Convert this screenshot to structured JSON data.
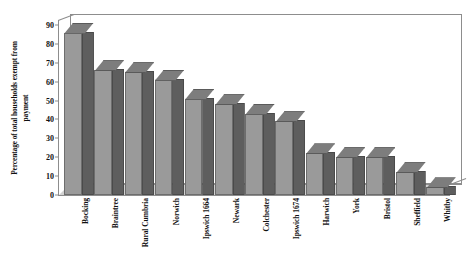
{
  "chart_data": {
    "type": "bar",
    "title": "",
    "xlabel": "",
    "ylabel": "Percentage of total households exempt from\npayment",
    "ylim": [
      0,
      90
    ],
    "yticks": [
      0,
      10,
      20,
      30,
      40,
      50,
      60,
      70,
      80,
      90
    ],
    "ytick_labels": [
      "0",
      "10",
      "20",
      "30",
      "40",
      "50",
      "60",
      "70",
      "80",
      "90"
    ],
    "grid": false,
    "legend": null,
    "style": "3d-column",
    "categories": [
      "Bocking",
      "Braintree",
      "Rural Cumbria",
      "Norwich",
      "Ipswich 1664",
      "Newark",
      "Colchester",
      "Ipswich 1674",
      "Harwich",
      "York",
      "Bristol",
      "Sheffield",
      "Whitby"
    ],
    "values": [
      86,
      66,
      65,
      61,
      51,
      48,
      43,
      39,
      22,
      20,
      20,
      12,
      4
    ],
    "colors": {
      "bar_front": "#9a9a9a",
      "bar_side": "#5e5e5e",
      "bar_top": "#7d7d7d",
      "floor": "#d2d2d2",
      "axis": "#8d8d8d",
      "text": "#111111",
      "background": "#ffffff"
    }
  }
}
